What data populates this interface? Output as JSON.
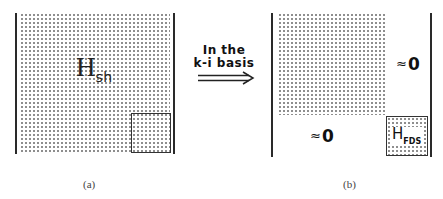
{
  "panel_a": {
    "matrix_label_main": "H",
    "matrix_label_sub": "sh",
    "caption": "(a)"
  },
  "transform": {
    "line1": "In the",
    "line2": "k-i basis",
    "arrow_icon": "double-right-arrow"
  },
  "panel_b": {
    "top_right_symbol": "≈",
    "top_right_value": "0",
    "bottom_left_symbol": "≈",
    "bottom_left_value": "0",
    "block_label_main": "H",
    "block_label_sub": "FDS",
    "caption": "(b)"
  },
  "colors": {
    "line": "#2a2a2a",
    "dots": "#8a8a8a",
    "background": "#ffffff"
  }
}
